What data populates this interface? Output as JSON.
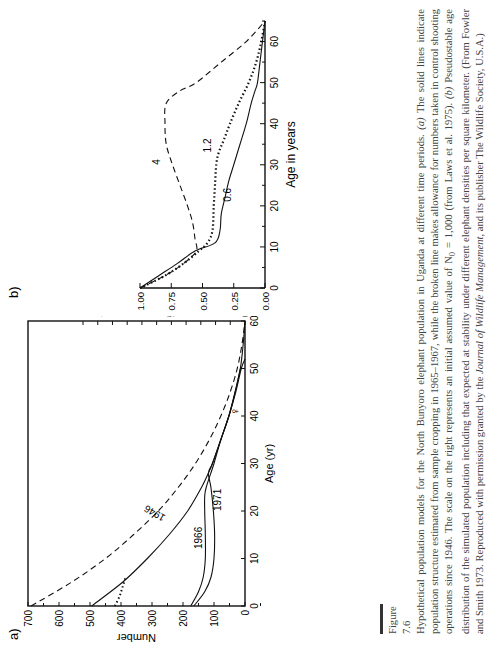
{
  "figure": {
    "label": "Figure 7.6",
    "caption_parts": [
      "Hypothetical population models for the North Bunyoro elephant population in Uganda at different time periods. ",
      "(a)",
      " The solid lines indicate population structure estimated from sample cropping in 1965–1967, while the broken line makes allowance for numbers taken in control shooting operations since 1946. The scale on the right represents an initial assumed value of N",
      "0",
      " = 1,000 (from Laws et al. 1975). ",
      "(b)",
      " Pseudostable age distribution of the simulated population including that expected at stability under different elephant densities per square kilometer. (From Fowler and Smith 1973. Reproduced with permission granted by the ",
      "Journal of Wildlife Management",
      ", and its publisher The Wildlife Society, U.S.A.)"
    ]
  },
  "chart_data": [
    {
      "panel": "a)",
      "type": "line",
      "xlabel": "Age (yr)",
      "ylabel": "Number",
      "y2label": "Number",
      "xlim": [
        0,
        60
      ],
      "ylim": [
        0,
        700
      ],
      "x_ticks": [
        "0",
        "10",
        "20",
        "30",
        "40",
        "50",
        "60"
      ],
      "y_ticks": [
        "0",
        "100",
        "200",
        "300",
        "400",
        "500",
        "600",
        "700"
      ],
      "y2_ticks": [
        "0",
        "500",
        "1000"
      ],
      "female_symbol": "♀",
      "series": [
        {
          "name": "1946 (broken line)",
          "style": "dashed",
          "x": [
            0,
            5,
            10,
            15,
            20,
            25,
            30,
            35,
            40,
            45,
            50,
            55,
            60
          ],
          "values": [
            690,
            560,
            450,
            360,
            280,
            215,
            160,
            115,
            78,
            48,
            25,
            10,
            0
          ]
        },
        {
          "name": "1946 (solid)",
          "style": "solid",
          "x": [
            0,
            5,
            10,
            15,
            20,
            25,
            28,
            30,
            35,
            40,
            45,
            50,
            55,
            60
          ],
          "values": [
            495,
            395,
            315,
            245,
            185,
            140,
            118,
            105,
            78,
            52,
            32,
            15,
            6,
            0
          ]
        },
        {
          "name": "1946 (dotted)",
          "style": "dotted",
          "x": [
            0,
            2,
            4,
            6
          ],
          "values": [
            420,
            405,
            395,
            385
          ]
        },
        {
          "name": "1966",
          "style": "solid",
          "x": [
            0,
            3,
            6,
            10,
            15,
            20,
            23,
            25,
            30,
            35,
            40,
            45,
            50
          ],
          "values": [
            175,
            150,
            135,
            128,
            128,
            130,
            130,
            125,
            100,
            78,
            52,
            32,
            15
          ]
        },
        {
          "name": "1971",
          "style": "solid",
          "x": [
            0,
            3,
            6,
            10,
            15,
            20,
            25,
            28,
            30,
            35,
            40,
            45,
            50,
            52
          ],
          "values": [
            165,
            130,
            110,
            100,
            98,
            102,
            110,
            118,
            105,
            78,
            52,
            30,
            12,
            0
          ]
        }
      ]
    },
    {
      "panel": "b)",
      "type": "line",
      "xlabel": "Age in years",
      "ylabel": "Relative abundance",
      "xlim": [
        0,
        65
      ],
      "ylim": [
        0,
        1.0
      ],
      "x_ticks": [
        "0",
        "10",
        "20",
        "30",
        "40",
        "50",
        "60"
      ],
      "y_ticks": [
        "0.00",
        "0.25",
        "0.50",
        "0.75",
        "1.00"
      ],
      "series": [
        {
          "name": "0.6",
          "style": "solid",
          "x": [
            0,
            3,
            6,
            9,
            11,
            14,
            18,
            22,
            26,
            30,
            35,
            40,
            45,
            48,
            50,
            55,
            60,
            65
          ],
          "values": [
            1.0,
            0.85,
            0.7,
            0.56,
            0.4,
            0.36,
            0.35,
            0.32,
            0.29,
            0.25,
            0.2,
            0.15,
            0.11,
            0.08,
            0.06,
            0.04,
            0.02,
            0.0
          ]
        },
        {
          "name": "1.2",
          "style": "dotted",
          "x": [
            0,
            3,
            6,
            9,
            11,
            14,
            20,
            25,
            30,
            33,
            36,
            40,
            45,
            50,
            55,
            60,
            65
          ],
          "values": [
            1.0,
            0.8,
            0.65,
            0.53,
            0.46,
            0.42,
            0.41,
            0.4,
            0.39,
            0.37,
            0.33,
            0.28,
            0.21,
            0.13,
            0.07,
            0.03,
            0.0
          ]
        },
        {
          "name": "4",
          "style": "dashed",
          "x": [
            0,
            3,
            6,
            9,
            12,
            16,
            20,
            25,
            30,
            35,
            40,
            45,
            48,
            50,
            55,
            60,
            65
          ],
          "values": [
            1.0,
            0.8,
            0.65,
            0.55,
            0.56,
            0.58,
            0.62,
            0.68,
            0.74,
            0.79,
            0.8,
            0.79,
            0.68,
            0.55,
            0.35,
            0.15,
            0.0
          ]
        }
      ]
    }
  ]
}
